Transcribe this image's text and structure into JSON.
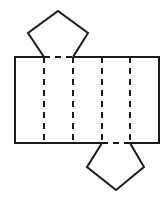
{
  "diagram": {
    "type": "net-of-pentagonal-prism",
    "stroke_color": "#1a1a1a",
    "background": "#ffffff",
    "rectangle": {
      "x": 15,
      "y": 57,
      "width": 144,
      "height": 86
    },
    "fold_lines_x": [
      44,
      73,
      102,
      130
    ],
    "top_pentagon": {
      "points": "44,57 28,33 58,11 88,33 73,57",
      "base": "44,57 73,57"
    },
    "bottom_pentagon": {
      "points": "102,143 87,167 116,190 144,167 130,143",
      "base": "102,143 130,143"
    }
  }
}
